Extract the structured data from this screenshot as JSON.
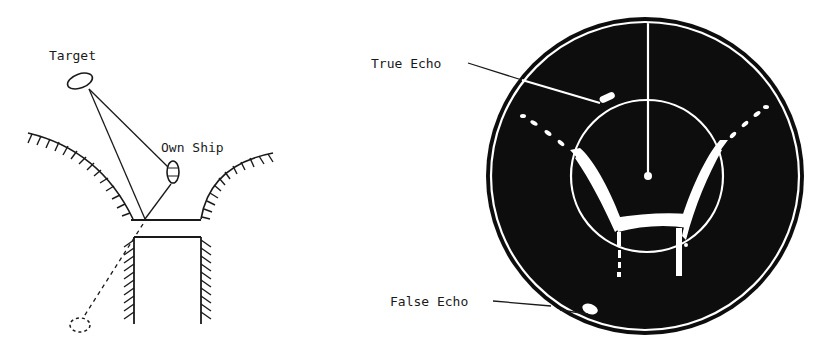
{
  "diagram": {
    "left_panel": {
      "labels": {
        "target": "Target",
        "own_ship": "Own Ship"
      }
    },
    "right_panel": {
      "labels": {
        "true_echo": "True Echo",
        "false_echo": "False Echo"
      }
    },
    "colors": {
      "ink": "#1a1a1a",
      "scope_background": "#0d0d0d",
      "echo": "#ffffff",
      "paper": "#ffffff"
    }
  }
}
